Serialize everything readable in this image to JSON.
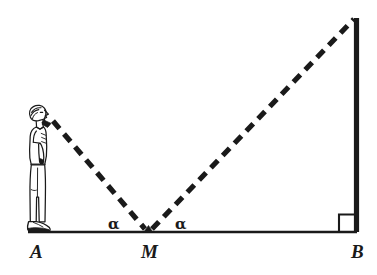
{
  "figure": {
    "kind": "geometry-diagram",
    "background_color": "#ffffff",
    "ink_color": "#1a1a1a",
    "labels": {
      "point_a": "A",
      "point_m": "M",
      "point_b": "B",
      "angle_left": "α",
      "angle_right": "α"
    },
    "elements": {
      "observer_name": "standing person in profile looking upward to the right",
      "baseline_name": "ground segment A to B",
      "tower_name": "vertical tower at B",
      "sightline_left_name": "dashed sight line from observer's eye down to M",
      "sightline_right_name": "dashed sight line from M up to top of tower",
      "right_angle_name": "right angle marker at B"
    },
    "geometry": {
      "baseline_y": 232,
      "point_a_x": 28,
      "point_m_x": 148,
      "point_b_x": 357,
      "tower_top_y": 18,
      "eye_x": 52,
      "eye_y": 120,
      "angle_left_value": "α",
      "angle_right_value": "α"
    }
  }
}
